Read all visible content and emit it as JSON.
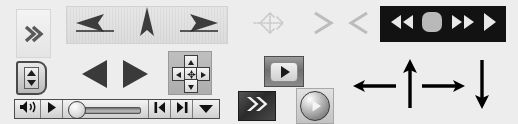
{
  "canvas": {
    "width": 518,
    "height": 124,
    "background": "#ededed",
    "description": "Collage of navigation and media-player control widgets"
  },
  "colors": {
    "page_background": "#ededed",
    "panel_light": "#e6e6e6",
    "panel_border": "#d2d2d2",
    "dark_bar": "#121212",
    "icon_dark": "#2f2f2f",
    "icon_light": "#e8e8e8",
    "icon_grey": "#b5b5b5",
    "arrow_black": "#000000"
  },
  "widgets": {
    "chevron_panel": {
      "name": "expand-panel",
      "icon": "chevron-double-right-icon",
      "glyph": "»",
      "tooltip": "Expand"
    },
    "triple_arrow_bar": {
      "name": "triple-arrow-toolbar",
      "buttons": [
        {
          "name": "arrow-left-button",
          "icon": "arrow-left-icon",
          "label": "Back"
        },
        {
          "name": "arrow-up-button",
          "icon": "arrow-up-icon",
          "label": "Up"
        },
        {
          "name": "arrow-right-button",
          "icon": "arrow-right-icon",
          "label": "Forward"
        }
      ]
    },
    "move_cursor": {
      "name": "move-cursor-icon",
      "icon": "move-four-way-icon",
      "label": "Move"
    },
    "grey_chevrons": [
      {
        "name": "chevron-right-icon",
        "glyph": ">",
        "label": "Next"
      },
      {
        "name": "chevron-left-icon",
        "glyph": "<",
        "label": "Previous"
      }
    ],
    "transport_bar": {
      "name": "media-transport-bar",
      "buttons": [
        {
          "name": "rewind-button",
          "icon": "rewind-icon",
          "label": "Rewind"
        },
        {
          "name": "stop-button",
          "icon": "stop-icon",
          "label": "Stop"
        },
        {
          "name": "fast-forward-button",
          "icon": "fast-forward-icon",
          "label": "Fast Forward"
        },
        {
          "name": "play-button",
          "icon": "play-icon",
          "label": "Play"
        }
      ]
    },
    "spinner_button": {
      "name": "vertical-spinner-button",
      "icon": "up-down-spinner-icon",
      "label": "Adjust"
    },
    "big_triangles": [
      {
        "name": "previous-button",
        "icon": "triangle-left-icon",
        "label": "Previous"
      },
      {
        "name": "next-button",
        "icon": "triangle-right-icon",
        "label": "Next"
      }
    ],
    "dpad": {
      "name": "direction-pad",
      "keys": [
        {
          "name": "dpad-up-key",
          "icon": "arrow-up-icon",
          "label": "Up"
        },
        {
          "name": "dpad-left-key",
          "icon": "arrow-left-icon",
          "label": "Left"
        },
        {
          "name": "dpad-center-key",
          "icon": "center-target-icon",
          "label": "Select"
        },
        {
          "name": "dpad-right-key",
          "icon": "arrow-right-icon",
          "label": "Right"
        },
        {
          "name": "dpad-down-key",
          "icon": "arrow-down-icon",
          "label": "Down"
        }
      ]
    },
    "media_strip": {
      "name": "media-slider-toolbar",
      "cells": [
        {
          "name": "volume-button",
          "icon": "speaker-icon",
          "label": "Volume"
        },
        {
          "name": "play-button",
          "icon": "play-icon",
          "label": "Play"
        },
        {
          "name": "seek-slider",
          "icon": "slider-icon",
          "label": "Seek",
          "value": 6
        },
        {
          "name": "step-back-button",
          "icon": "step-backward-icon",
          "label": "Step Back"
        },
        {
          "name": "step-fwd-button",
          "icon": "step-forward-icon",
          "label": "Step Forward"
        },
        {
          "name": "menu-button",
          "icon": "caret-down-icon",
          "label": "Menu"
        }
      ]
    },
    "play_rect_button": {
      "name": "play-rect-button",
      "icon": "play-icon",
      "label": "Play"
    },
    "fast_forward_button": {
      "name": "fast-forward-button",
      "icon": "chevron-double-right-icon",
      "label": "Fast Forward"
    },
    "round_play_button": {
      "name": "round-play-button",
      "icon": "play-circle-icon",
      "label": "Play"
    },
    "direction_arrows": [
      {
        "name": "arrow-left-glyph",
        "icon": "arrow-left-icon",
        "label": "Left"
      },
      {
        "name": "arrow-up-glyph",
        "icon": "arrow-up-icon",
        "label": "Up"
      },
      {
        "name": "arrow-right-glyph",
        "icon": "arrow-right-icon",
        "label": "Right"
      },
      {
        "name": "arrow-down-glyph",
        "icon": "arrow-down-icon",
        "label": "Down"
      }
    ]
  }
}
